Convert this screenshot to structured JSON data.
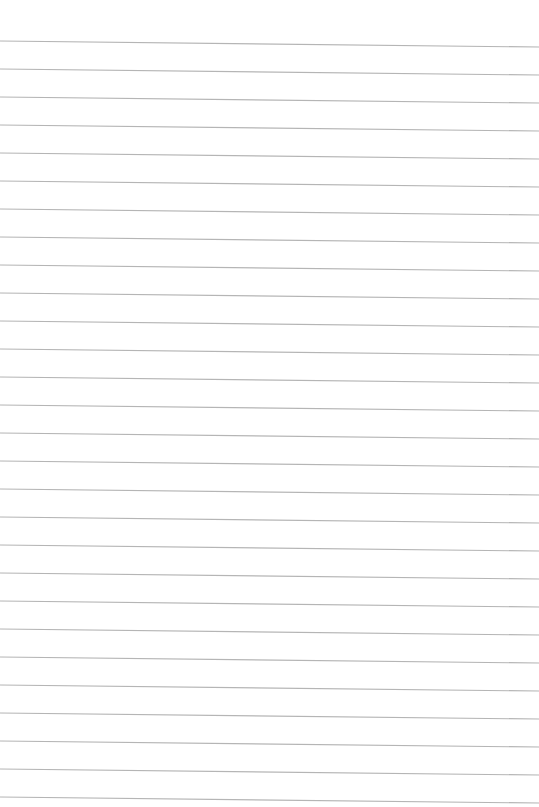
{
  "page": {
    "type": "lined-paper",
    "line_count": 28,
    "line_color": "#b5b5b5",
    "background_color": "#ffffff"
  }
}
